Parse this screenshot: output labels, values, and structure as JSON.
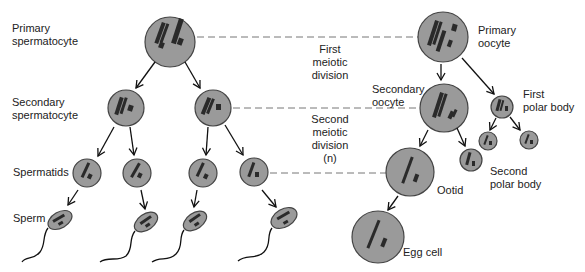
{
  "diagram": {
    "labels": {
      "primary_spermatocyte": "Primary\nspermatocyte",
      "secondary_spermatocyte": "Secondary\nspermatocyte",
      "spermatids": "Spermatids",
      "sperm": "Sperm",
      "first_meiotic_division": "First\nmeiotic\ndivision",
      "second_meiotic_division": "Second\nmeiotic\ndivision\n(n)",
      "primary_oocyte": "Primary\noocyte",
      "secondary_oocyte": "Secondary\noocyte",
      "first_polar_body": "First\npolar body",
      "second_polar_body": "Second\npolar body",
      "ootid": "Ootid",
      "egg_cell": "Egg cell"
    },
    "colors": {
      "cell_fill": "#9a9a9a",
      "cell_stroke": "#444444",
      "chromosome": "#2a2a2a",
      "dashed_line": "#777777",
      "text": "#222222"
    }
  }
}
